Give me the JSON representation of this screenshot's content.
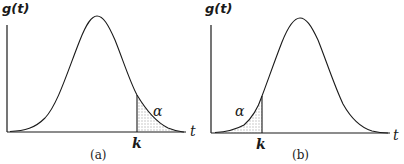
{
  "panels": [
    {
      "id": "a",
      "caption": "(a)",
      "y_label": "g(t)",
      "x_label": "t",
      "critical_label": "k",
      "area_label": "α",
      "tail": "right"
    },
    {
      "id": "b",
      "caption": "(b)",
      "y_label": "g(t)",
      "x_label": "t",
      "critical_label": "k",
      "area_label": "α",
      "tail": "left"
    }
  ],
  "colors": {
    "ink": "#1a1a1a",
    "shade": "#c8c8c8"
  }
}
